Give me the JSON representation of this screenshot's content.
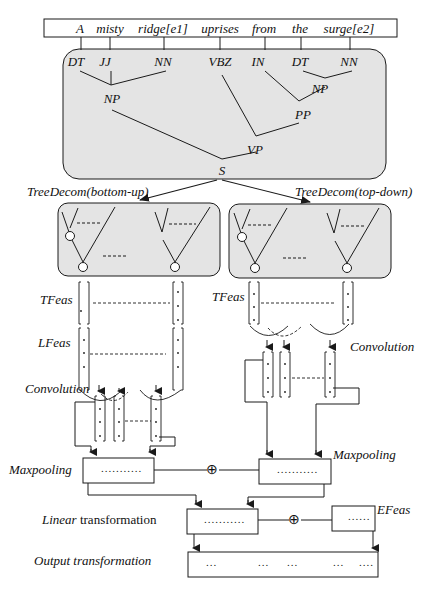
{
  "sentence": {
    "words": [
      {
        "text": "A",
        "x": 80
      },
      {
        "text": "misty",
        "x": 110
      },
      {
        "text": "ridge[e1]",
        "x": 163
      },
      {
        "text": "uprises",
        "x": 220
      },
      {
        "text": "from",
        "x": 264
      },
      {
        "text": "the",
        "x": 300
      },
      {
        "text": "surge[e2]",
        "x": 349
      }
    ]
  },
  "parse_tree": {
    "pos_tags": [
      {
        "text": "DT",
        "x": 76
      },
      {
        "text": "JJ",
        "x": 105
      },
      {
        "text": "NN",
        "x": 163
      },
      {
        "text": "VBZ",
        "x": 220
      },
      {
        "text": "IN",
        "x": 258
      },
      {
        "text": "DT",
        "x": 300
      },
      {
        "text": "NN",
        "x": 349
      }
    ],
    "phrases": [
      {
        "text": "NP",
        "x": 112,
        "y": 92
      },
      {
        "text": "NP",
        "x": 320,
        "y": 82
      },
      {
        "text": "PP",
        "x": 303,
        "y": 108
      },
      {
        "text": "VP",
        "x": 255,
        "y": 143
      },
      {
        "text": "S",
        "x": 222,
        "y": 166
      }
    ]
  },
  "tree_decomposition": {
    "left_label": "TreeDecom(bottom-up)",
    "right_label": "TreeDecom(top-down)",
    "ellipsis": "----"
  },
  "features": {
    "tfeas_label": "TFeas",
    "lfeas_label": "LFeas",
    "efeas_label": "EFeas"
  },
  "operations": {
    "convolution_left": "Convolution",
    "convolution_right": "Convolution",
    "maxpooling_left": "Maxpooling",
    "maxpooling_right": "Maxpooling",
    "linear_italic": "Linear",
    "linear_rest": " transformation",
    "output": "Output transformation",
    "concat_symbol": "⊕"
  },
  "vectors": {
    "maxpool_left_dots": "...........",
    "maxpool_right_dots": "...........",
    "linear_dots": "...........",
    "efeas_dots": "......",
    "output_dots": [
      "...",
      "...",
      "...",
      "...",
      "...."
    ]
  },
  "colors": {
    "panel_fill": "#e4e4e4",
    "stroke": "#1a1a1a"
  }
}
